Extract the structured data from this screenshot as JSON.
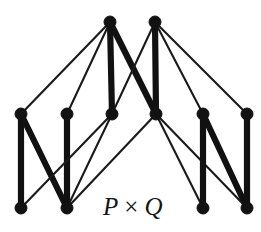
{
  "figure": {
    "name": "hasse-diagram-product-poset",
    "label": "P × Q",
    "label_left": "P",
    "label_operator": "×",
    "label_right": "Q",
    "label_x": 103,
    "label_y": 215,
    "background": "#ffffff",
    "ink_color": "#121212",
    "thin_width": 2.1,
    "thick_width": 6.2,
    "vertex_radius": 6.0
  },
  "chart_data": {
    "type": "diagram",
    "subtitle": "",
    "xlabel": "",
    "ylabel": "",
    "grid": false,
    "legend": "none",
    "levels": [
      {
        "name": "top",
        "y": 22,
        "count": 2
      },
      {
        "name": "middle",
        "y": 114,
        "count": 6
      },
      {
        "name": "bottom",
        "y": 208,
        "count": 4
      }
    ],
    "nodes": [
      {
        "id": "t1",
        "level": "top",
        "x": 110,
        "y": 22
      },
      {
        "id": "t2",
        "level": "top",
        "x": 155,
        "y": 22
      },
      {
        "id": "m1",
        "level": "middle",
        "x": 21,
        "y": 114
      },
      {
        "id": "m2",
        "level": "middle",
        "x": 67,
        "y": 114
      },
      {
        "id": "m3",
        "level": "middle",
        "x": 112,
        "y": 114
      },
      {
        "id": "m4",
        "level": "middle",
        "x": 156,
        "y": 114
      },
      {
        "id": "m5",
        "level": "middle",
        "x": 203,
        "y": 114
      },
      {
        "id": "m6",
        "level": "middle",
        "x": 247,
        "y": 114
      },
      {
        "id": "b1",
        "level": "bottom",
        "x": 21,
        "y": 208
      },
      {
        "id": "b2",
        "level": "bottom",
        "x": 67,
        "y": 208
      },
      {
        "id": "b3",
        "level": "bottom",
        "x": 203,
        "y": 208
      },
      {
        "id": "b4",
        "level": "bottom",
        "x": 247,
        "y": 208
      }
    ],
    "edges": [
      {
        "from": "t1",
        "to": "m1",
        "weight": "thin"
      },
      {
        "from": "t1",
        "to": "m2",
        "weight": "thin"
      },
      {
        "from": "t1",
        "to": "m3",
        "weight": "thick"
      },
      {
        "from": "t1",
        "to": "m4",
        "weight": "thick"
      },
      {
        "from": "t2",
        "to": "m3",
        "weight": "thin"
      },
      {
        "from": "t2",
        "to": "m4",
        "weight": "thick"
      },
      {
        "from": "t2",
        "to": "m5",
        "weight": "thin"
      },
      {
        "from": "t2",
        "to": "m6",
        "weight": "thin"
      },
      {
        "from": "m1",
        "to": "b1",
        "weight": "thick"
      },
      {
        "from": "m1",
        "to": "b2",
        "weight": "thick"
      },
      {
        "from": "m2",
        "to": "b2",
        "weight": "thick"
      },
      {
        "from": "m3",
        "to": "b2",
        "weight": "thin"
      },
      {
        "from": "m3",
        "to": "b1",
        "weight": "thin"
      },
      {
        "from": "m4",
        "to": "b3",
        "weight": "thin"
      },
      {
        "from": "m4",
        "to": "b2",
        "weight": "thin"
      },
      {
        "from": "m4",
        "to": "b4",
        "weight": "thin"
      },
      {
        "from": "m5",
        "to": "b3",
        "weight": "thick"
      },
      {
        "from": "m5",
        "to": "b4",
        "weight": "thick"
      },
      {
        "from": "m6",
        "to": "b4",
        "weight": "thick"
      }
    ]
  }
}
